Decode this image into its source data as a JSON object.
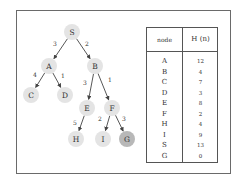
{
  "tree": {
    "nodes": [
      {
        "id": "S",
        "label": "S",
        "x": 72,
        "y": 32,
        "goal": false
      },
      {
        "id": "A",
        "label": "A",
        "x": 49,
        "y": 66,
        "goal": false
      },
      {
        "id": "B",
        "label": "B",
        "x": 95,
        "y": 66,
        "goal": false
      },
      {
        "id": "C",
        "label": "C",
        "x": 31,
        "y": 95,
        "goal": false
      },
      {
        "id": "D",
        "label": "D",
        "x": 65,
        "y": 95,
        "goal": false
      },
      {
        "id": "E",
        "label": "E",
        "x": 87,
        "y": 108,
        "goal": false
      },
      {
        "id": "F",
        "label": "F",
        "x": 112,
        "y": 108,
        "goal": false
      },
      {
        "id": "H",
        "label": "H",
        "x": 76,
        "y": 139,
        "goal": false
      },
      {
        "id": "I",
        "label": "I",
        "x": 103,
        "y": 139,
        "goal": false
      },
      {
        "id": "G",
        "label": "G",
        "x": 127,
        "y": 139,
        "goal": true
      }
    ],
    "edges": [
      {
        "from": "S",
        "to": "A",
        "cost": "3",
        "lx": 55,
        "ly": 46
      },
      {
        "from": "S",
        "to": "B",
        "cost": "2",
        "lx": 87,
        "ly": 46
      },
      {
        "from": "A",
        "to": "C",
        "cost": "4",
        "lx": 35,
        "ly": 77
      },
      {
        "from": "A",
        "to": "D",
        "cost": "1",
        "lx": 63,
        "ly": 78
      },
      {
        "from": "B",
        "to": "E",
        "cost": "3",
        "lx": 85,
        "ly": 85
      },
      {
        "from": "B",
        "to": "F",
        "cost": "1",
        "lx": 110,
        "ly": 82
      },
      {
        "from": "E",
        "to": "H",
        "cost": "5",
        "lx": 75,
        "ly": 125
      },
      {
        "from": "F",
        "to": "I",
        "cost": "2",
        "lx": 100,
        "ly": 121
      },
      {
        "from": "F",
        "to": "G",
        "cost": "3",
        "lx": 124,
        "ly": 121
      }
    ],
    "colors": {
      "node_fill": "#e4e4e4",
      "goal_fill": "#b8b8b8",
      "edge": "#444444",
      "text": "#333333"
    }
  },
  "table": {
    "headers": [
      "node",
      "H (n)"
    ],
    "rows": [
      {
        "node": "A",
        "h": "12"
      },
      {
        "node": "B",
        "h": "4"
      },
      {
        "node": "C",
        "h": "7"
      },
      {
        "node": "D",
        "h": "3"
      },
      {
        "node": "E",
        "h": "8"
      },
      {
        "node": "F",
        "h": "2"
      },
      {
        "node": "H",
        "h": "4"
      },
      {
        "node": "I",
        "h": "9"
      },
      {
        "node": "S",
        "h": "13"
      },
      {
        "node": "G",
        "h": "0"
      }
    ]
  }
}
